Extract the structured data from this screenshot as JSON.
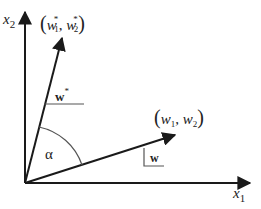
{
  "diagram": {
    "type": "vector-angle-diagram",
    "axes": {
      "x_label": "x",
      "x_sub": "1",
      "y_label": "x",
      "y_sub": "2"
    },
    "vectors": [
      {
        "name": "w_star",
        "point_label_open": "(",
        "point_label_w": "w",
        "point_label_sub1": "1",
        "point_label_sup": "*",
        "point_label_comma": ", ",
        "point_label_sub2": "2",
        "point_label_close": ")",
        "tag": "w",
        "tag_sup": "*"
      },
      {
        "name": "w",
        "point_label_open": "(",
        "point_label_w": "w",
        "point_label_sub1": "1",
        "point_label_comma": ", ",
        "point_label_sub2": "2",
        "point_label_close": ")",
        "tag": "w"
      }
    ],
    "angle_label": "α",
    "colors": {
      "stroke": "#1a1a1a",
      "thin_stroke": "#555555",
      "background": "#ffffff"
    }
  }
}
